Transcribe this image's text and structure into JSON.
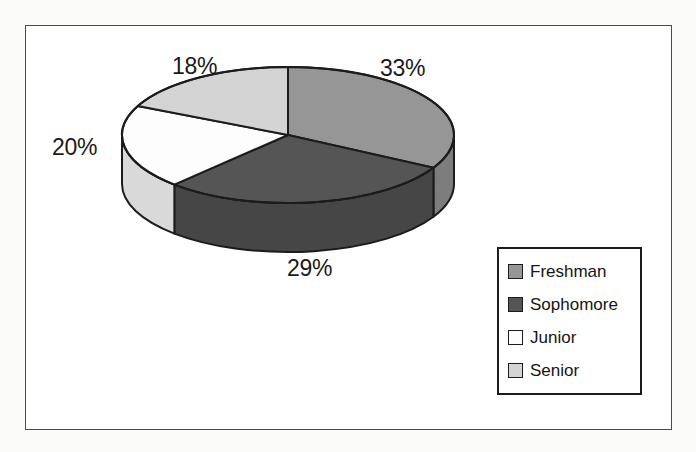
{
  "chart_data": {
    "type": "pie",
    "title": "",
    "categories": [
      "Freshman",
      "Sophomore",
      "Junior",
      "Senior"
    ],
    "values": [
      33,
      29,
      20,
      18
    ],
    "value_unit": "%",
    "data_labels": [
      "33%",
      "29%",
      "18%",
      "20%"
    ],
    "legend_position": "bottom-right",
    "three_d": true,
    "start_angle_deg": 0,
    "direction": "clockwise",
    "colors": [
      "#969696",
      "#555555",
      "#fdfdfd",
      "#d4d4d4"
    ],
    "slices": [
      {
        "label": "Freshman",
        "value": 33,
        "display": "33%",
        "color": "#969696",
        "side_color": "#7d7d7d"
      },
      {
        "label": "Sophomore",
        "value": 29,
        "display": "29%",
        "color": "#555555",
        "side_color": "#464646"
      },
      {
        "label": "Junior",
        "value": 20,
        "display": "20%",
        "color": "#fdfdfd",
        "side_color": "#d9d9d9"
      },
      {
        "label": "Senior",
        "value": 18,
        "display": "18%",
        "color": "#d4d4d4",
        "side_color": "#b4b4b4"
      }
    ]
  },
  "labels": {
    "freshman_pct": "33%",
    "sophomore_pct": "29%",
    "junior_pct": "18%",
    "senior_pct": "20%"
  },
  "legend": {
    "items": [
      {
        "label": "Freshman",
        "color": "#969696"
      },
      {
        "label": "Sophomore",
        "color": "#555555"
      },
      {
        "label": "Junior",
        "color": "#fdfdfd"
      },
      {
        "label": "Senior",
        "color": "#d4d4d4"
      }
    ]
  },
  "style": {
    "outline": "#1c1c1c",
    "frame": "#4a4a4a",
    "page_background": "#fbfbfa",
    "chart_background": "#ffffff"
  }
}
